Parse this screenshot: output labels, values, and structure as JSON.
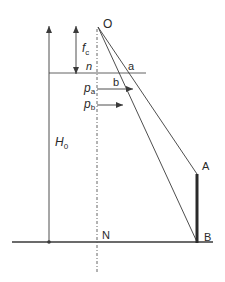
{
  "diagram": {
    "colors": {
      "background": "#ffffff",
      "line": "#3a3a3a",
      "thick_member": "#2a2a2a",
      "axis": "#555555"
    },
    "points": {
      "O": {
        "label": "O",
        "x": 98,
        "y": 27
      },
      "A": {
        "label": "A",
        "x": 197,
        "y": 174
      },
      "B": {
        "label": "B",
        "x": 197,
        "y": 242
      },
      "N": {
        "label": "N",
        "x": 97,
        "y": 242
      },
      "a": {
        "label": "a"
      },
      "b": {
        "label": "b"
      },
      "n": {
        "label": "n"
      }
    },
    "dimensions": {
      "H0": {
        "main": "H",
        "sub": "0"
      },
      "fc": {
        "main": "f",
        "sub": "c"
      }
    },
    "forces": {
      "pa": {
        "main": "p",
        "sub": "a"
      },
      "pb": {
        "main": "p",
        "sub": "b"
      }
    }
  }
}
